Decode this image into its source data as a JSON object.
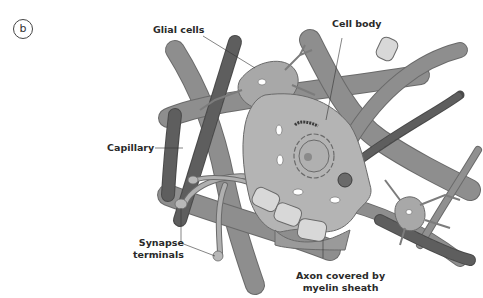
{
  "figure": {
    "panel_letter": "b",
    "labels": {
      "glial_cells": "Glial cells",
      "cell_body": "Cell body",
      "capillary": "Capillary",
      "synapse_line1": "Synapse",
      "synapse_line2": "terminals",
      "axon_line1": "Axon covered by",
      "axon_line2": "myelin sheath"
    },
    "colors": {
      "background": "#ffffff",
      "vessel": "#8e8e8e",
      "vessel_outline": "#6a6a6a",
      "capillary": "#5a5a5a",
      "cell_body": "#b4b4b4",
      "glial": "#a8a8a8",
      "myelin": "#d8d8d8",
      "text": "#2a2a2a"
    }
  }
}
